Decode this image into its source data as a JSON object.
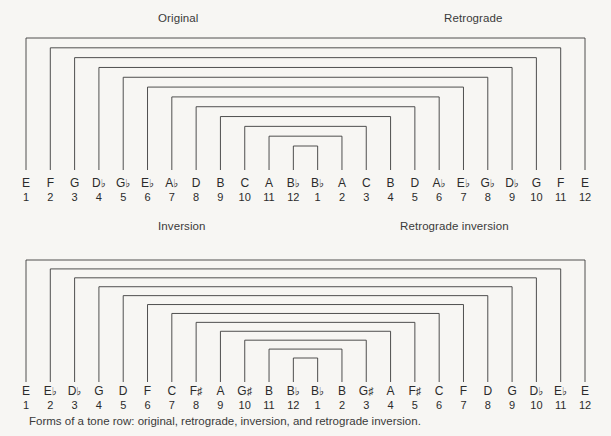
{
  "figure": {
    "caption": "Forms of a tone row: original, retrograde, inversion, and retrograde inversion.",
    "background_color": "#f7f6f3",
    "line_color": "#3c3c3c"
  },
  "panels": [
    {
      "id": "top",
      "title_left": "Original",
      "title_right": "Retrograde",
      "left_row": {
        "notes": [
          "E",
          "F",
          "G",
          "D♭",
          "G♭",
          "E♭",
          "A♭",
          "D",
          "B",
          "C",
          "A",
          "B♭"
        ],
        "numbers": [
          "1",
          "2",
          "3",
          "4",
          "5",
          "6",
          "7",
          "8",
          "9",
          "10",
          "11",
          "12"
        ]
      },
      "right_row": {
        "notes": [
          "B♭",
          "A",
          "C",
          "B",
          "D",
          "A♭",
          "E♭",
          "G♭",
          "D♭",
          "G",
          "F",
          "E"
        ],
        "numbers": [
          "1",
          "2",
          "3",
          "4",
          "5",
          "6",
          "7",
          "8",
          "9",
          "10",
          "11",
          "12"
        ]
      }
    },
    {
      "id": "bottom",
      "title_left": "Inversion",
      "title_right": "Retrograde inversion",
      "left_row": {
        "notes": [
          "E",
          "E♭",
          "D♭",
          "G",
          "D",
          "F",
          "C",
          "F♯",
          "A",
          "G♯",
          "B",
          "B♭"
        ],
        "numbers": [
          "1",
          "2",
          "3",
          "4",
          "5",
          "6",
          "7",
          "8",
          "9",
          "10",
          "11",
          "12"
        ]
      },
      "right_row": {
        "notes": [
          "B♭",
          "B",
          "G♯",
          "A",
          "F♯",
          "C",
          "F",
          "D",
          "G",
          "D♭",
          "E♭",
          "E"
        ],
        "numbers": [
          "1",
          "2",
          "3",
          "4",
          "5",
          "6",
          "7",
          "8",
          "9",
          "10",
          "11",
          "12"
        ]
      }
    }
  ],
  "geometry": {
    "bracket_count": 12,
    "left_first_x": 26,
    "right_last_x": 585,
    "column_step": 24.3,
    "note": "Twelve nested rectangular brackets connect each pitch of the row (positions 1-12, left) to its mirror pitch (positions 12-1, right)."
  }
}
